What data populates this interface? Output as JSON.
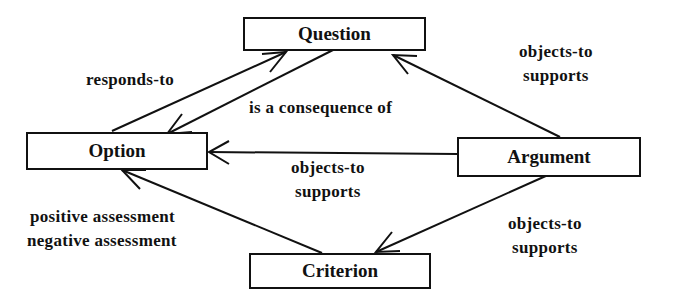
{
  "nodes": {
    "question": "Question",
    "option": "Option",
    "argument": "Argument",
    "criterion": "Criterion"
  },
  "edges": [
    {
      "from": "option",
      "to": "question",
      "labels": [
        "responds-to"
      ]
    },
    {
      "from": "question",
      "to": "option",
      "labels": [
        "is a consequence of"
      ]
    },
    {
      "from": "argument",
      "to": "question",
      "labels": [
        "objects-to",
        "supports"
      ]
    },
    {
      "from": "argument",
      "to": "option",
      "labels": [
        "objects-to",
        "supports"
      ]
    },
    {
      "from": "criterion",
      "to": "option",
      "labels": [
        "positive assessment",
        "negative assessment"
      ]
    },
    {
      "from": "argument",
      "to": "criterion",
      "labels": [
        "objects-to",
        "supports"
      ]
    }
  ]
}
